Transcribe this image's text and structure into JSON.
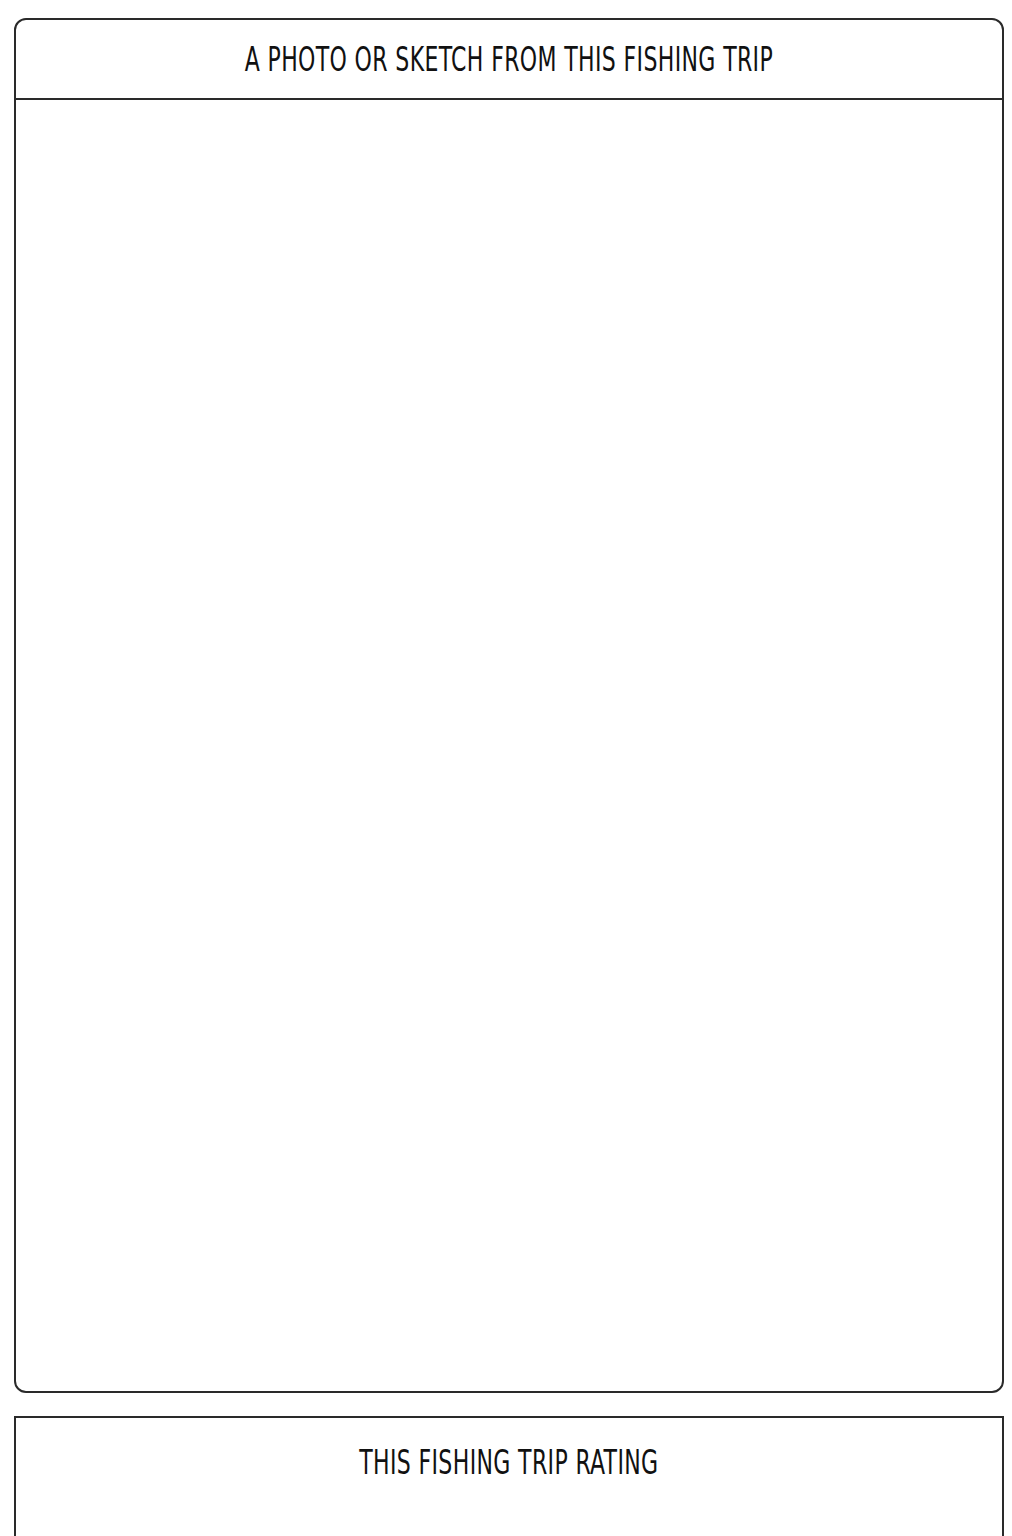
{
  "photo_section": {
    "title": "A PHOTO OR SKETCH FROM THIS FISHING TRIP"
  },
  "rating_section": {
    "title": "THIS FISHING TRIP RATING"
  }
}
